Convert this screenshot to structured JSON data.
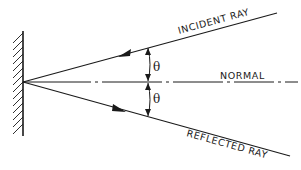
{
  "diagram": {
    "labels": {
      "incident": "INCIDENT RAY",
      "reflected": "REFLECTED RAY",
      "normal": "NORMAL",
      "angle_top": "θ",
      "angle_bottom": "θ"
    },
    "elements": [
      {
        "id": "mirror",
        "type": "plane mirror (hatched surface)"
      },
      {
        "id": "incident-ray",
        "type": "ray",
        "direction": "toward mirror"
      },
      {
        "id": "reflected-ray",
        "type": "ray",
        "direction": "away from mirror"
      },
      {
        "id": "normal",
        "type": "dash-dot line"
      },
      {
        "id": "angle-of-incidence",
        "label": "θ"
      },
      {
        "id": "angle-of-reflection",
        "label": "θ"
      }
    ],
    "colors": {
      "line": "#1a1a1a",
      "background": "#ffffff"
    }
  }
}
